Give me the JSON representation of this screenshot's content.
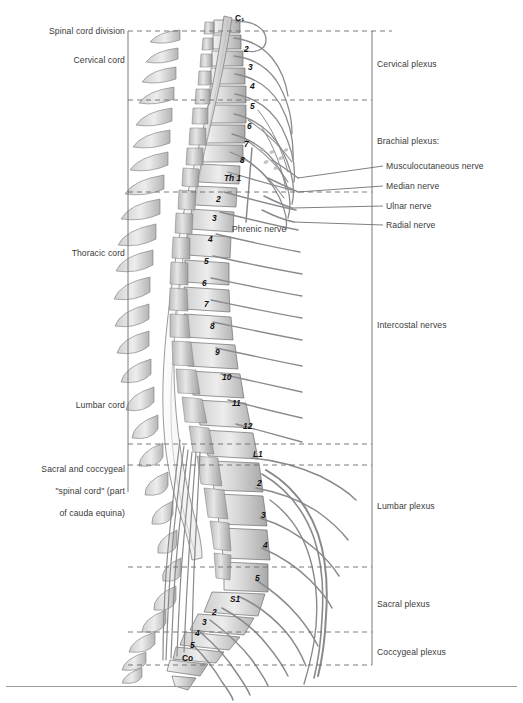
{
  "figure": {
    "type": "anatomical-diagram",
    "colors": {
      "bone_light": "#e8e8e8",
      "bone_mid": "#c9c9c9",
      "bone_dark": "#9d9d9d",
      "nerve": "#8e8e92",
      "outline": "#6e6e6e",
      "bracket": "#7a7a7a",
      "text": "#3a3a3a"
    }
  },
  "left_labels": [
    {
      "id": "spinal-cord-division",
      "text": "Spinal cord division",
      "x": 27,
      "y": 31,
      "w": 98
    },
    {
      "id": "cervical-cord",
      "text": "Cervical cord",
      "x": 51,
      "y": 60,
      "w": 74
    },
    {
      "id": "thoracic-cord",
      "text": "Thoracic cord",
      "x": 50,
      "y": 253,
      "w": 75
    },
    {
      "id": "lumbar-cord",
      "text": "Lumbar cord",
      "x": 54,
      "y": 405,
      "w": 71
    }
  ],
  "left_labels_multiline": [
    {
      "id": "sacral-coccygeal-cord",
      "lines": [
        "Sacral and coccygeal",
        "\"spinal cord\" (part",
        "of cauda equina)"
      ],
      "x": 14,
      "y": 456,
      "w": 111
    }
  ],
  "right_labels": [
    {
      "id": "cervical-plexus",
      "text": "Cervical plexus",
      "x": 377,
      "y": 63
    },
    {
      "id": "brachial-plexus",
      "text": "Brachial plexus:",
      "x": 377,
      "y": 140
    },
    {
      "id": "intercostal-nerves",
      "text": "Intercostal nerves",
      "x": 377,
      "y": 324
    },
    {
      "id": "lumbar-plexus",
      "text": "Lumbar plexus",
      "x": 377,
      "y": 505
    },
    {
      "id": "sacral-plexus",
      "text": "Sacral plexus",
      "x": 377,
      "y": 603
    },
    {
      "id": "coccygeal-plexus",
      "text": "Coccygeal plexus",
      "x": 377,
      "y": 651
    }
  ],
  "brachial_branches": [
    {
      "id": "musculocutaneous-nerve",
      "text": "Musculocutaneous nerve",
      "x": 385,
      "y": 165,
      "leader_y": 168,
      "anchor_x": 295,
      "anchor_y": 178
    },
    {
      "id": "median-nerve",
      "text": "Median nerve",
      "x": 385,
      "y": 185,
      "leader_y": 188,
      "anchor_x": 295,
      "anchor_y": 192
    },
    {
      "id": "ulnar-nerve",
      "text": "Ulnar nerve",
      "x": 385,
      "y": 205,
      "leader_y": 208,
      "anchor_x": 288,
      "anchor_y": 208
    },
    {
      "id": "radial-nerve",
      "text": "Radial nerve",
      "x": 385,
      "y": 224,
      "leader_y": 227,
      "anchor_x": 290,
      "anchor_y": 221
    }
  ],
  "inline_labels": [
    {
      "id": "phrenic-nerve",
      "text": "Phrenic nerve",
      "x": 232,
      "y": 228
    }
  ],
  "vertebra_numbers": [
    {
      "id": "c1",
      "text": "C₁",
      "x": 235,
      "y": 13,
      "italic": false
    },
    {
      "id": "c2",
      "text": "2",
      "x": 244,
      "y": 44,
      "italic": true
    },
    {
      "id": "c3",
      "text": "3",
      "x": 248,
      "y": 62,
      "italic": true
    },
    {
      "id": "c4",
      "text": "4",
      "x": 250,
      "y": 81,
      "italic": true
    },
    {
      "id": "c5",
      "text": "5",
      "x": 250,
      "y": 101,
      "italic": true
    },
    {
      "id": "c6",
      "text": "6",
      "x": 247,
      "y": 121,
      "italic": true
    },
    {
      "id": "c7",
      "text": "7",
      "x": 244,
      "y": 139,
      "italic": true
    },
    {
      "id": "c8",
      "text": "8",
      "x": 240,
      "y": 155,
      "italic": true
    },
    {
      "id": "th1",
      "text": "Th 1",
      "x": 224,
      "y": 173,
      "italic": true
    },
    {
      "id": "th2",
      "text": "2",
      "x": 216,
      "y": 194,
      "italic": true
    },
    {
      "id": "th3",
      "text": "3",
      "x": 212,
      "y": 213,
      "italic": true
    },
    {
      "id": "th4",
      "text": "4",
      "x": 208,
      "y": 234,
      "italic": true
    },
    {
      "id": "th5",
      "text": "5",
      "x": 204,
      "y": 256,
      "italic": true
    },
    {
      "id": "th6",
      "text": "6",
      "x": 202,
      "y": 278,
      "italic": true
    },
    {
      "id": "th7",
      "text": "7",
      "x": 204,
      "y": 299,
      "italic": true
    },
    {
      "id": "th8",
      "text": "8",
      "x": 210,
      "y": 321,
      "italic": true
    },
    {
      "id": "th9",
      "text": "9",
      "x": 215,
      "y": 347,
      "italic": true
    },
    {
      "id": "th10",
      "text": "10",
      "x": 222,
      "y": 372,
      "italic": true
    },
    {
      "id": "th11",
      "text": "11",
      "x": 232,
      "y": 398,
      "italic": true
    },
    {
      "id": "th12",
      "text": "12",
      "x": 243,
      "y": 421,
      "italic": true
    },
    {
      "id": "l1",
      "text": "L1",
      "x": 253,
      "y": 449,
      "italic": true
    },
    {
      "id": "l2",
      "text": "2",
      "x": 257,
      "y": 478,
      "italic": true
    },
    {
      "id": "l3",
      "text": "3",
      "x": 261,
      "y": 510,
      "italic": true
    },
    {
      "id": "l4",
      "text": "4",
      "x": 263,
      "y": 540,
      "italic": true
    },
    {
      "id": "l5",
      "text": "5",
      "x": 255,
      "y": 573,
      "italic": true
    },
    {
      "id": "s1",
      "text": "S1",
      "x": 230,
      "y": 594,
      "italic": true
    },
    {
      "id": "s2",
      "text": "2",
      "x": 212,
      "y": 607,
      "italic": true
    },
    {
      "id": "s3",
      "text": "3",
      "x": 202,
      "y": 617,
      "italic": true
    },
    {
      "id": "s4",
      "text": "4",
      "x": 195,
      "y": 628,
      "italic": true
    },
    {
      "id": "s5",
      "text": "5",
      "x": 190,
      "y": 640,
      "italic": true
    },
    {
      "id": "co",
      "text": "Co",
      "x": 182,
      "y": 653,
      "italic": false
    }
  ],
  "division_lines": [
    {
      "id": "division-top",
      "y": 31,
      "x1": 128,
      "x2": 392
    },
    {
      "id": "division-cervical-brachial",
      "y": 100,
      "x1": 128,
      "x2": 372
    },
    {
      "id": "division-brachial-thoracic",
      "y": 192,
      "x1": 128,
      "x2": 372
    },
    {
      "id": "division-thoracic-lumbar",
      "y": 444,
      "x1": 128,
      "x2": 372
    },
    {
      "id": "division-lumbar-sacral",
      "y": 465,
      "x1": 128,
      "x2": 372
    },
    {
      "id": "division-sacral",
      "y": 567,
      "x1": 128,
      "x2": 372
    },
    {
      "id": "division-coccygeal",
      "y": 632,
      "x1": 128,
      "x2": 372
    },
    {
      "id": "division-bottom",
      "y": 665,
      "x1": 128,
      "x2": 372
    }
  ],
  "brackets": {
    "left_bracket": {
      "id": "left-cord-bracket",
      "x": 128,
      "y1": 31,
      "y2": 665
    },
    "right_bracket": {
      "id": "right-plexus-bracket",
      "x": 372,
      "y1": 31,
      "y2": 665
    }
  },
  "footer": {
    "rule_label": "figure-footer-rule"
  }
}
